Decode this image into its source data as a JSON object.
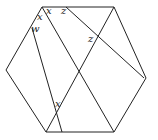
{
  "diagram": {
    "type": "geometry",
    "shape": "hexagon",
    "stroke_color": "#222222",
    "background": "#ffffff",
    "labels": [
      {
        "id": "x1",
        "text": "x",
        "x": 46,
        "y": 14
      },
      {
        "id": "x2",
        "text": "x",
        "x": 37,
        "y": 20
      },
      {
        "id": "z1",
        "text": "z",
        "x": 61,
        "y": 14
      },
      {
        "id": "w",
        "text": "w",
        "x": 31,
        "y": 32
      },
      {
        "id": "z2",
        "text": "z",
        "x": 88,
        "y": 42
      },
      {
        "id": "x3",
        "text": "x",
        "x": 55,
        "y": 107
      }
    ]
  }
}
